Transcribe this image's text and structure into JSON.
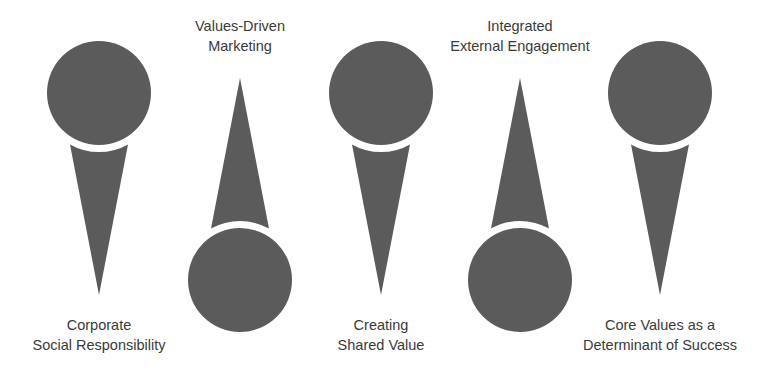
{
  "diagram": {
    "fill_color": "#5b5b5b",
    "items": [
      {
        "orientation": "circle-top",
        "label_position": "bottom",
        "lines": [
          "Corporate",
          "Social Responsibility"
        ]
      },
      {
        "orientation": "circle-bottom",
        "label_position": "top",
        "lines": [
          "Values-Driven",
          "Marketing"
        ]
      },
      {
        "orientation": "circle-top",
        "label_position": "bottom",
        "lines": [
          "Creating",
          "Shared Value"
        ]
      },
      {
        "orientation": "circle-bottom",
        "label_position": "top",
        "lines": [
          "Integrated",
          "External Engagement"
        ]
      },
      {
        "orientation": "circle-top",
        "label_position": "bottom",
        "lines": [
          "Core Values as a",
          "Determinant of Success"
        ]
      }
    ]
  }
}
